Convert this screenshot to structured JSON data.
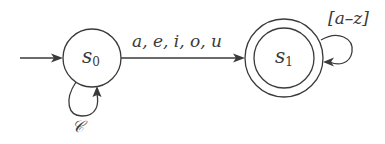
{
  "diagram": {
    "type": "finite-state-automaton",
    "states": [
      {
        "id": "s0",
        "label_base": "s",
        "label_sub": "0",
        "initial": true,
        "accepting": false
      },
      {
        "id": "s1",
        "label_base": "s",
        "label_sub": "1",
        "initial": false,
        "accepting": true
      }
    ],
    "transitions": [
      {
        "from": "s0",
        "to": "s1",
        "label": "a, e, i, o, u"
      },
      {
        "from": "s0",
        "to": "s0",
        "label": "𝒞"
      },
      {
        "from": "s1",
        "to": "s1",
        "label": "[a–z]"
      }
    ],
    "colors": {
      "stroke": "#3a3a3a",
      "background": "#ffffff"
    }
  }
}
